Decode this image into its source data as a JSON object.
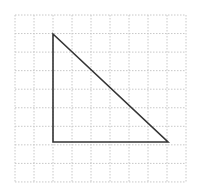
{
  "diagram": {
    "type": "grid-with-triangle",
    "background": "#ffffff",
    "grid": {
      "origin_px": [
        15,
        15
      ],
      "columns": 9,
      "rows": 9,
      "cell_width_px": 19,
      "cell_height_px": 18.55,
      "line_color": "#c8c8c8",
      "line_style": "dotted"
    },
    "triangle": {
      "vertices_grid": [
        [
          2,
          1
        ],
        [
          2,
          7
        ],
        [
          8,
          7
        ]
      ],
      "vertices_px": [
        [
          53,
          34
        ],
        [
          53,
          142
        ],
        [
          168,
          142
        ]
      ],
      "stroke_color": "#333333",
      "stroke_width": 1.6,
      "fill": "none",
      "right_angle_at": "bottom-left",
      "leg_lengths_units": {
        "vertical": 6,
        "horizontal": 6
      }
    }
  }
}
